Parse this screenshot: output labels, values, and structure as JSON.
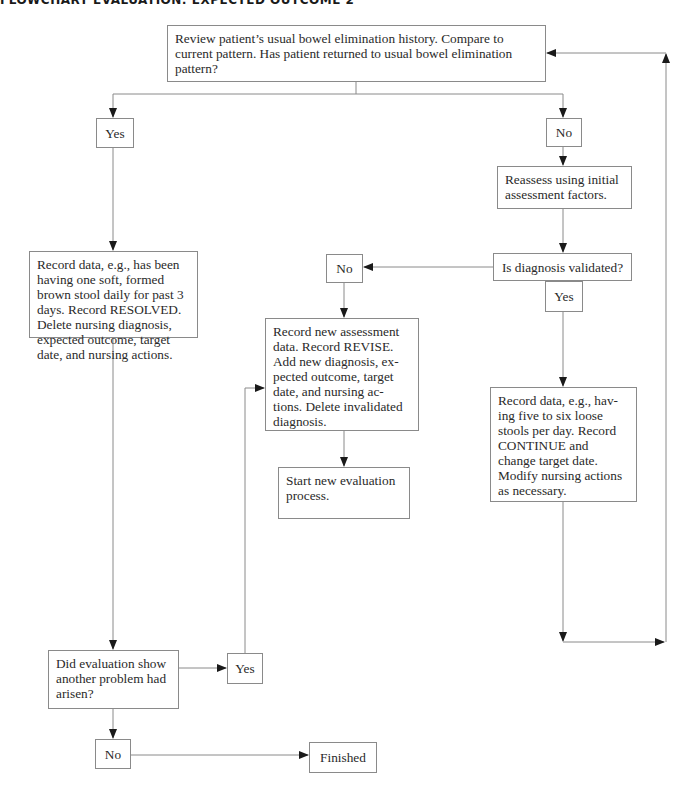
{
  "title": "FLOWCHART EVALUATION: EXPECTED OUTCOME 2",
  "nodes": {
    "start": "Review patient’s usual bowel elimination history. Compare to current pattern. Has patient returned to usual bowel elimination pattern?",
    "yes_top": "Yes",
    "no_top": "No",
    "reassess": "Reassess using initial assessment factors.",
    "validated": "Is diagnosis validated?",
    "no_validated": "No",
    "yes_validated": "Yes",
    "resolved": "Record data, e.g., has been having one soft, formed brown stool daily for past 3 days. Record RESOLVED. Delete nursing diagnosis, expected outcome, target date, and nursing actions.",
    "revise": "Record new assessment data. Record REVISE. Add new diagnosis, ex-pected outcome, target date, and nursing ac-tions. Delete invalidated diagnosis.",
    "start_new": "Start new evaluation process.",
    "continue": "Record data, e.g., hav-ing five to six loose stools per day. Record CONTINUE and change target date. Modify nursing actions as necessary.",
    "another_problem": "Did evaluation show another problem had arisen?",
    "yes_problem": "Yes",
    "no_problem": "No",
    "finished": "Finished"
  },
  "colors": {
    "line": "#8a8a8a",
    "arrow": "#1a1a1a",
    "text": "#2a2a2a"
  }
}
